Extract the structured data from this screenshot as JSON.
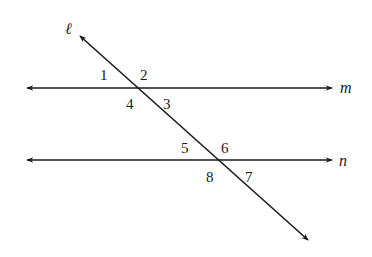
{
  "diagram": {
    "title": "",
    "background": "#ffffff",
    "stroke_color": "#1a1a1a",
    "lines": {
      "transversal": {
        "label": "ℓ",
        "from": [
          80,
          36
        ],
        "to": [
          308,
          240
        ]
      },
      "m": {
        "label": "m",
        "y": 88,
        "x_start": 27,
        "x_end": 332
      },
      "n": {
        "label": "n",
        "y": 160,
        "x_start": 27,
        "x_end": 332
      }
    },
    "angles": [
      {
        "id": "1",
        "label": "1"
      },
      {
        "id": "2",
        "label": "2"
      },
      {
        "id": "3",
        "label": "3"
      },
      {
        "id": "4",
        "label": "4"
      },
      {
        "id": "5",
        "label": "5"
      },
      {
        "id": "6",
        "label": "6"
      },
      {
        "id": "7",
        "label": "7"
      },
      {
        "id": "8",
        "label": "8"
      }
    ]
  }
}
